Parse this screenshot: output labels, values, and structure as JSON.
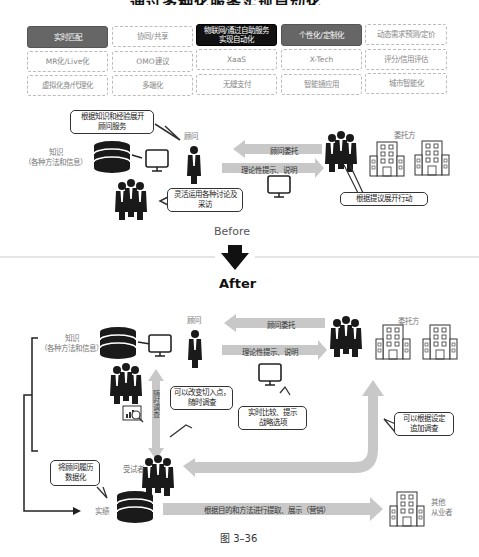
{
  "header": {
    "title_clipped": "通过多种化服务实现自动化"
  },
  "feature_grid": {
    "rows": [
      [
        {
          "label": "实时匹配",
          "style": "gray"
        },
        {
          "label": "协同/共享",
          "style": "dashed"
        },
        {
          "label": "物联网/通过自助服务\n实现自动化",
          "style": "black"
        },
        {
          "label": "个性化/定制化",
          "style": "gray"
        },
        {
          "label": "动态需求预测/定价",
          "style": "dashed"
        }
      ],
      [
        {
          "label": "MR化/Live化",
          "style": "dashed"
        },
        {
          "label": "OMO建议",
          "style": "dashed"
        },
        {
          "label": "XaaS",
          "style": "dashed"
        },
        {
          "label": "X-Tech",
          "style": "dashed"
        },
        {
          "label": "评分/信用评估",
          "style": "dashed"
        }
      ],
      [
        {
          "label": "虚拟化身/代理化",
          "style": "dashed"
        },
        {
          "label": "多端化",
          "style": "dashed"
        },
        {
          "label": "无缝支付",
          "style": "dashed"
        },
        {
          "label": "智能镜应用",
          "style": "dashed"
        },
        {
          "label": "城市智能化",
          "style": "dashed"
        }
      ]
    ]
  },
  "before": {
    "bubble_knowledge_service": "根据知识和经验展开\n顾问服务",
    "consultant_label": "顾问",
    "knowledge_label": "知识\n（各种方法和信息）",
    "arrow_commission": "顾问委托",
    "arrow_theory": "理论性提示、说明",
    "client_label": "委托方",
    "bubble_discussion": "灵活运用各种讨论及\n采访",
    "bubble_action": "根据提议展开行动",
    "section_label": "Before"
  },
  "after": {
    "section_label": "After",
    "consultant_label": "顾问",
    "knowledge_label": "知识\n（各种方法和信息）",
    "arrow_commission": "顾问委托",
    "arrow_theory": "理论性提示、说明",
    "client_label": "委托方",
    "bubble_change_entry": "可以改变切入点，\n随时调查",
    "vertical_arrow_label": "随时调查",
    "bubble_realtime": "实时比较、提示\n战略选项",
    "bubble_additional": "可以根据设定\n追加调查",
    "respondent_label": "受试者",
    "bubble_datafy": "将顾问履历\n数据化",
    "record_label": "实绩",
    "arrow_extract": "根据目的和方法进行提取、展示（营销）",
    "other_label": "其他\n从业者"
  },
  "figure_caption": "图 3–36",
  "colors": {
    "arrow_gray": "#c8c8c8",
    "cell_gray": "#666666",
    "cell_black": "#111111",
    "icon_dark": "#1a1a1a"
  }
}
